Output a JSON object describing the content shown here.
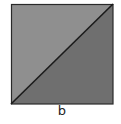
{
  "figure": {
    "label": "b",
    "square": {
      "x": 11,
      "y": 4,
      "size": 102
    },
    "colors": {
      "upper_left_triangle": "#8f8f8f",
      "lower_right_triangle": "#6f6f6f",
      "border": "#2a2a2a",
      "diagonal": "#1a1a1a"
    }
  }
}
